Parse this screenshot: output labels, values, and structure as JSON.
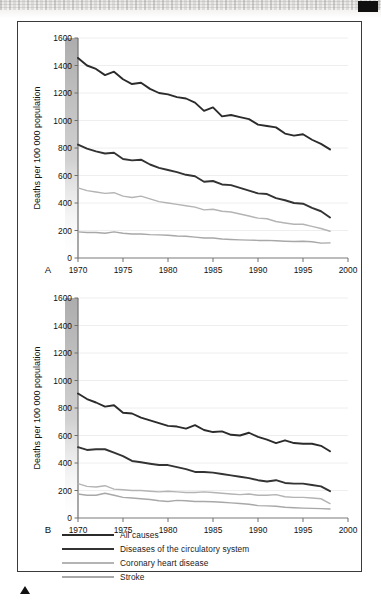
{
  "figure": {
    "panels": [
      {
        "letter": "A"
      },
      {
        "letter": "B"
      }
    ],
    "legend": [
      {
        "key": "all_causes",
        "label": "All causes",
        "color": "#2b2b2b"
      },
      {
        "key": "circulatory",
        "label": "Diseases of the circulatory system",
        "color": "#333333"
      },
      {
        "key": "chd",
        "label": "Coronary heart disease",
        "color": "#b4b4b4"
      },
      {
        "key": "stroke",
        "label": "Stroke",
        "color": "#a8a8a8"
      }
    ]
  },
  "chart_data": [
    {
      "id": "panel-a",
      "type": "line",
      "title": "",
      "panel_letter": "A",
      "xlabel": "",
      "ylabel": "Deaths per 100 000 population",
      "xlim": [
        1970,
        2000
      ],
      "ylim": [
        0,
        1600
      ],
      "xticks": [
        1970,
        1975,
        1980,
        1985,
        1990,
        1995,
        2000
      ],
      "yticks": [
        0,
        200,
        400,
        600,
        800,
        1000,
        1200,
        1400,
        1600
      ],
      "xtick_labels": [
        "1970",
        "1975",
        "1980",
        "1985",
        "1990",
        "1995",
        "2000"
      ],
      "ytick_labels": [
        "0",
        "200",
        "400",
        "600",
        "800",
        "1000",
        "1200",
        "1400",
        "1600"
      ],
      "grid": "horizontal",
      "legend_position": "below-figure",
      "x": [
        1970,
        1971,
        1972,
        1973,
        1974,
        1975,
        1976,
        1977,
        1978,
        1979,
        1980,
        1981,
        1982,
        1983,
        1984,
        1985,
        1986,
        1987,
        1988,
        1989,
        1990,
        1991,
        1992,
        1993,
        1994,
        1995,
        1996,
        1997,
        1998
      ],
      "series": [
        {
          "name": "All causes",
          "color": "#2b2b2b",
          "values": [
            1455,
            1400,
            1375,
            1330,
            1355,
            1300,
            1265,
            1275,
            1230,
            1200,
            1190,
            1170,
            1160,
            1130,
            1070,
            1095,
            1030,
            1040,
            1025,
            1010,
            970,
            960,
            950,
            905,
            890,
            900,
            860,
            830,
            790
          ]
        },
        {
          "name": "Diseases of the circulatory system",
          "color": "#333333",
          "values": [
            825,
            795,
            775,
            760,
            765,
            720,
            710,
            715,
            680,
            655,
            640,
            625,
            605,
            595,
            555,
            560,
            535,
            530,
            510,
            490,
            470,
            465,
            435,
            420,
            400,
            395,
            365,
            340,
            295
          ]
        },
        {
          "name": "Coronary heart disease",
          "color": "#b4b4b4",
          "values": [
            510,
            490,
            480,
            470,
            475,
            450,
            440,
            450,
            430,
            410,
            400,
            390,
            380,
            370,
            350,
            355,
            340,
            335,
            320,
            305,
            290,
            285,
            265,
            255,
            245,
            245,
            230,
            215,
            195
          ]
        },
        {
          "name": "Stroke",
          "color": "#a8a8a8",
          "values": [
            190,
            185,
            185,
            180,
            190,
            180,
            175,
            175,
            170,
            168,
            165,
            160,
            158,
            152,
            145,
            145,
            138,
            135,
            132,
            130,
            128,
            128,
            125,
            122,
            120,
            122,
            118,
            108,
            110
          ]
        }
      ]
    },
    {
      "id": "panel-b",
      "type": "line",
      "title": "",
      "panel_letter": "B",
      "xlabel": "",
      "ylabel": "Deaths per 100 000 population",
      "xlim": [
        1970,
        2000
      ],
      "ylim": [
        0,
        1600
      ],
      "xticks": [
        1970,
        1975,
        1980,
        1985,
        1990,
        1995,
        2000
      ],
      "yticks": [
        0,
        200,
        400,
        600,
        800,
        1000,
        1200,
        1400,
        1600
      ],
      "xtick_labels": [
        "1970",
        "1975",
        "1980",
        "1985",
        "1990",
        "1995",
        "2000"
      ],
      "ytick_labels": [
        "0",
        "200",
        "400",
        "600",
        "800",
        "1000",
        "1200",
        "1400",
        "1600"
      ],
      "grid": "horizontal",
      "legend_position": "below-figure",
      "x": [
        1970,
        1971,
        1972,
        1973,
        1974,
        1975,
        1976,
        1977,
        1978,
        1979,
        1980,
        1981,
        1982,
        1983,
        1984,
        1985,
        1986,
        1987,
        1988,
        1989,
        1990,
        1991,
        1992,
        1993,
        1994,
        1995,
        1996,
        1997,
        1998
      ],
      "series": [
        {
          "name": "All causes",
          "color": "#2b2b2b",
          "values": [
            905,
            865,
            840,
            810,
            820,
            765,
            760,
            730,
            710,
            690,
            670,
            665,
            650,
            675,
            640,
            625,
            630,
            605,
            600,
            620,
            590,
            570,
            545,
            565,
            545,
            540,
            540,
            525,
            485
          ]
        },
        {
          "name": "Diseases of the circulatory system",
          "color": "#333333",
          "values": [
            515,
            495,
            500,
            500,
            475,
            450,
            415,
            405,
            395,
            385,
            385,
            370,
            355,
            335,
            335,
            330,
            320,
            310,
            300,
            290,
            275,
            265,
            275,
            255,
            250,
            250,
            240,
            230,
            195
          ]
        },
        {
          "name": "Coronary heart disease",
          "color": "#b4b4b4",
          "values": [
            250,
            230,
            225,
            235,
            210,
            205,
            200,
            200,
            195,
            190,
            195,
            190,
            185,
            185,
            190,
            185,
            180,
            175,
            170,
            175,
            165,
            165,
            170,
            155,
            150,
            150,
            145,
            140,
            105
          ]
        },
        {
          "name": "Stroke",
          "color": "#a8a8a8",
          "values": [
            175,
            165,
            165,
            180,
            165,
            150,
            145,
            140,
            135,
            125,
            120,
            128,
            125,
            120,
            120,
            118,
            115,
            110,
            105,
            100,
            90,
            88,
            85,
            78,
            75,
            72,
            70,
            68,
            65
          ]
        }
      ]
    }
  ]
}
